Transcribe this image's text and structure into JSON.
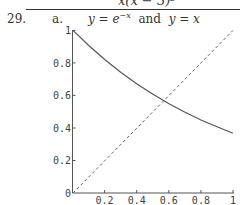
{
  "header": {
    "partial_fraction_denominator": "x(x − 3)²"
  },
  "problem": {
    "number": "29.",
    "part": "a.",
    "caption": {
      "y1": "y = e",
      "y1_exponent": "−x",
      "connector": "and",
      "y2": "y = x"
    }
  },
  "chart_data": {
    "type": "line",
    "xlabel": "",
    "ylabel": "",
    "xlim": [
      0,
      1
    ],
    "ylim": [
      0,
      1
    ],
    "grid": false,
    "legend": null,
    "x_ticks": [
      "0.2",
      "0.4",
      "0.6",
      "0.8",
      "1"
    ],
    "y_ticks": [
      "0",
      "0.2",
      "0.4",
      "0.6",
      "0.8",
      "1"
    ],
    "series": [
      {
        "name": "y = e^(-x)",
        "style": "solid",
        "x": [
          0,
          0.1,
          0.2,
          0.3,
          0.4,
          0.5,
          0.6,
          0.7,
          0.8,
          0.9,
          1.0
        ],
        "y": [
          1.0,
          0.905,
          0.819,
          0.741,
          0.67,
          0.607,
          0.549,
          0.497,
          0.449,
          0.407,
          0.368
        ]
      },
      {
        "name": "y = x",
        "style": "dashed",
        "x": [
          0,
          1
        ],
        "y": [
          0,
          1
        ]
      }
    ],
    "annotations": [
      {
        "text": "intersection",
        "x": 0.567,
        "y": 0.567
      }
    ]
  }
}
